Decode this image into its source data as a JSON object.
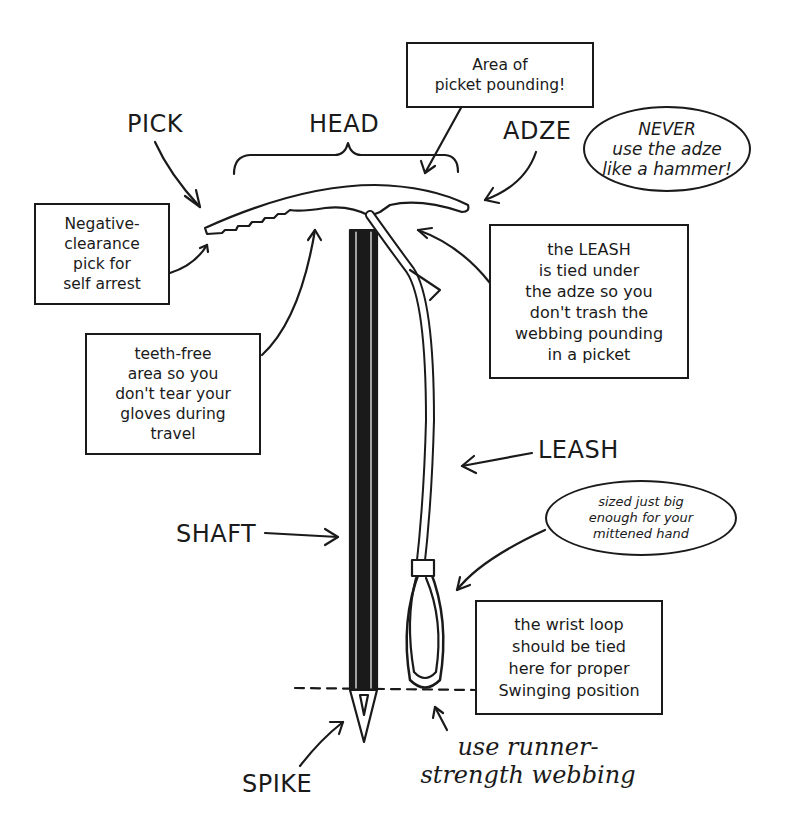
{
  "labels": {
    "pick": "PICK",
    "head": "HEAD",
    "adze": "ADZE",
    "shaft": "SHAFT",
    "leash": "LEASH",
    "spike": "SPIKE"
  },
  "callouts": {
    "picket_pounding": "Area of\npicket pounding!",
    "never_adze": "NEVER\nuse the adze\nlike a hammer!",
    "negative_clearance": "Negative-\nclearance\npick for\nself arrest",
    "leash_tied": "the LEASH\nis tied under\nthe adze so you\ndon't trash the\nwebbing pounding\nin a picket",
    "teeth_free": "teeth-free\narea so you\ndon't tear your\ngloves during\ntravel",
    "sized_loop": "sized just big\nenough for your\nmittened hand",
    "wrist_loop": "the wrist loop\nshould be tied\nhere for proper\nSwinging position",
    "runner_webbing": "use runner-\nstrength webbing"
  },
  "colors": {
    "ink": "#1a1a1a",
    "paper": "#ffffff"
  }
}
